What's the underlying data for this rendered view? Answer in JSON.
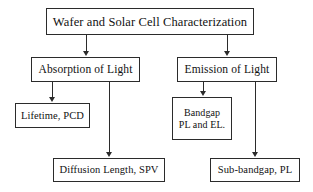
{
  "diagram": {
    "background_color": "#ffffff",
    "border_color": "#2b2b2b",
    "text_color": "#111111",
    "nodes": {
      "root": {
        "label": "Wafer and Solar Cell Characterization"
      },
      "absorption": {
        "label": "Absorption of Light"
      },
      "emission": {
        "label": "Emission of Light"
      },
      "lifetime": {
        "label": "Lifetime, PCD"
      },
      "bandgap": {
        "line1": "Bandgap",
        "line2": "PL and EL."
      },
      "diffusion": {
        "label": "Diffusion Length, SPV"
      },
      "subbandgap": {
        "label": "Sub-bandgap, PL"
      }
    },
    "edges": [
      {
        "from": "root",
        "to": "absorption"
      },
      {
        "from": "root",
        "to": "emission"
      },
      {
        "from": "absorption",
        "to": "lifetime"
      },
      {
        "from": "absorption",
        "to": "diffusion"
      },
      {
        "from": "emission",
        "to": "bandgap"
      },
      {
        "from": "emission",
        "to": "subbandgap"
      }
    ]
  }
}
